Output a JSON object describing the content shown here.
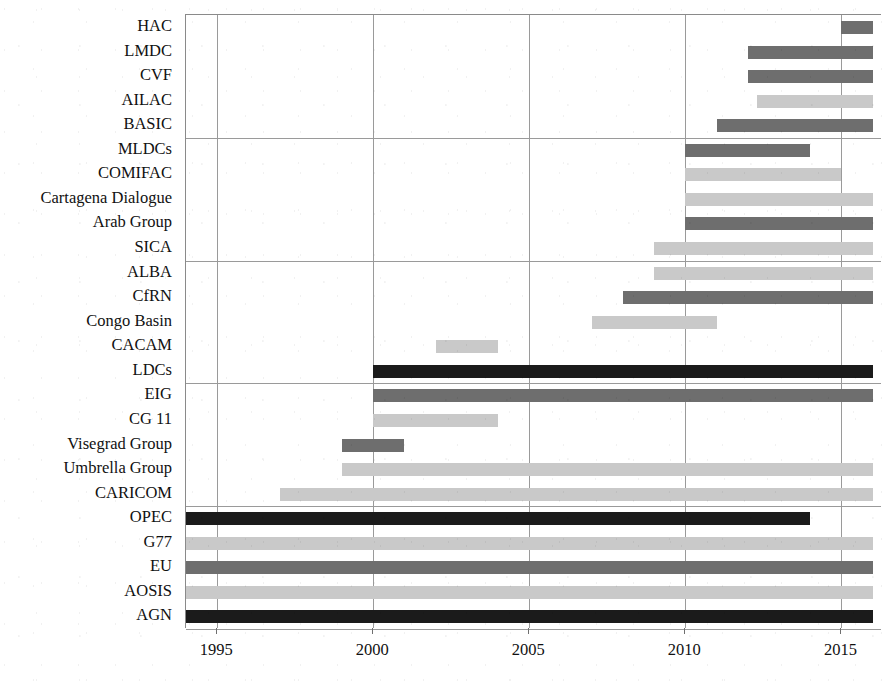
{
  "chart_data": {
    "type": "bar",
    "subtype": "gantt-timeline",
    "title": "",
    "xlabel": "",
    "ylabel": "",
    "xlim": [
      1994.0,
      2016.3
    ],
    "ylim": [
      0,
      24
    ],
    "grid": "vertical-gridlines-at-xticks-plus-three-horizontal-separators",
    "legend": "none",
    "xticks": [
      1995,
      2000,
      2005,
      2010,
      2015
    ],
    "xtick_labels": [
      "1995",
      "2000",
      "2005",
      "2010",
      "2015"
    ],
    "colors": {
      "black": "#1b1b1b",
      "dark_gray": "#6e6e6e",
      "light_gray": "#c9c9c9"
    },
    "categories": [
      "HAC",
      "LMDC",
      "CVF",
      "AILAC",
      "BASIC",
      "MLDCs",
      "COMIFAC",
      "Cartagena Dialogue",
      "Arab Group",
      "SICA",
      "ALBA",
      "CfRN",
      "Congo Basin",
      "CACAM",
      "LDCs",
      "EIG",
      "CG 11",
      "Visegrad Group",
      "Umbrella Group",
      "CARICOM",
      "OPEC",
      "G77",
      "EU",
      "AOSIS",
      "AGN"
    ],
    "bars": [
      {
        "label": "HAC",
        "start": 2015.0,
        "end": 2016.0,
        "color": "#6e6e6e",
        "shade": "dark_gray"
      },
      {
        "label": "LMDC",
        "start": 2012.0,
        "end": 2016.0,
        "color": "#6e6e6e",
        "shade": "dark_gray"
      },
      {
        "label": "CVF",
        "start": 2012.0,
        "end": 2016.0,
        "color": "#6e6e6e",
        "shade": "dark_gray"
      },
      {
        "label": "AILAC",
        "start": 2012.3,
        "end": 2016.0,
        "color": "#c9c9c9",
        "shade": "light_gray"
      },
      {
        "label": "BASIC",
        "start": 2011.0,
        "end": 2016.0,
        "color": "#6e6e6e",
        "shade": "dark_gray"
      },
      {
        "label": "MLDCs",
        "start": 2010.0,
        "end": 2014.0,
        "color": "#6e6e6e",
        "shade": "dark_gray"
      },
      {
        "label": "COMIFAC",
        "start": 2010.0,
        "end": 2015.0,
        "color": "#c9c9c9",
        "shade": "light_gray"
      },
      {
        "label": "Cartagena Dialogue",
        "start": 2010.0,
        "end": 2016.0,
        "color": "#c9c9c9",
        "shade": "light_gray"
      },
      {
        "label": "Arab Group",
        "start": 2010.0,
        "end": 2016.0,
        "color": "#6e6e6e",
        "shade": "dark_gray"
      },
      {
        "label": "SICA",
        "start": 2009.0,
        "end": 2016.0,
        "color": "#c9c9c9",
        "shade": "light_gray"
      },
      {
        "label": "ALBA",
        "start": 2009.0,
        "end": 2016.0,
        "color": "#c9c9c9",
        "shade": "light_gray"
      },
      {
        "label": "CfRN",
        "start": 2008.0,
        "end": 2016.0,
        "color": "#6e6e6e",
        "shade": "dark_gray"
      },
      {
        "label": "Congo Basin",
        "start": 2007.0,
        "end": 2011.0,
        "color": "#c9c9c9",
        "shade": "light_gray"
      },
      {
        "label": "CACAM",
        "start": 2002.0,
        "end": 2004.0,
        "color": "#c9c9c9",
        "shade": "light_gray"
      },
      {
        "label": "LDCs",
        "start": 2000.0,
        "end": 2016.0,
        "color": "#1b1b1b",
        "shade": "black"
      },
      {
        "label": "EIG",
        "start": 2000.0,
        "end": 2016.0,
        "color": "#6e6e6e",
        "shade": "dark_gray"
      },
      {
        "label": "CG 11",
        "start": 2000.0,
        "end": 2004.0,
        "color": "#c9c9c9",
        "shade": "light_gray"
      },
      {
        "label": "Visegrad Group",
        "start": 1999.0,
        "end": 2001.0,
        "color": "#6e6e6e",
        "shade": "dark_gray"
      },
      {
        "label": "Umbrella Group",
        "start": 1999.0,
        "end": 2016.0,
        "color": "#c9c9c9",
        "shade": "light_gray"
      },
      {
        "label": "CARICOM",
        "start": 1997.0,
        "end": 2016.0,
        "color": "#c9c9c9",
        "shade": "light_gray"
      },
      {
        "label": "OPEC",
        "start": 1994.0,
        "end": 2014.0,
        "color": "#1b1b1b",
        "shade": "black"
      },
      {
        "label": "G77",
        "start": 1994.0,
        "end": 2016.0,
        "color": "#c9c9c9",
        "shade": "light_gray"
      },
      {
        "label": "EU",
        "start": 1994.0,
        "end": 2016.0,
        "color": "#6e6e6e",
        "shade": "dark_gray"
      },
      {
        "label": "AOSIS",
        "start": 1994.0,
        "end": 2016.0,
        "color": "#c9c9c9",
        "shade": "light_gray"
      },
      {
        "label": "AGN",
        "start": 1994.0,
        "end": 2016.0,
        "color": "#1b1b1b",
        "shade": "black"
      }
    ],
    "horizontal_separator_rows": [
      4,
      9,
      14,
      19
    ]
  }
}
